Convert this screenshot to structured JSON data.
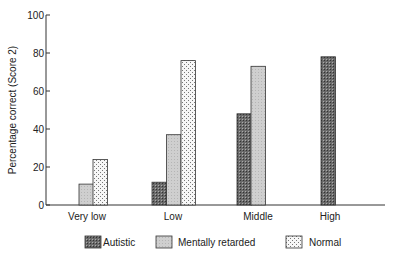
{
  "chart_data": {
    "type": "bar",
    "title": "",
    "xlabel": "",
    "ylabel": "Percentage correct (Score 2)",
    "ylim": [
      0,
      100
    ],
    "yticks": [
      0,
      20,
      40,
      60,
      80,
      100
    ],
    "categories": [
      "Very low",
      "Low",
      "Middle",
      "High"
    ],
    "series": [
      {
        "name": "Autistic",
        "pattern": "dark-crosshatch",
        "color": "#555555",
        "values": [
          null,
          12,
          48,
          78
        ]
      },
      {
        "name": "Mentally retarded",
        "pattern": "light-grey",
        "color": "#cccccc",
        "values": [
          11,
          37,
          73,
          null
        ]
      },
      {
        "name": "Normal",
        "pattern": "dotted",
        "color": "#f2f2f2",
        "values": [
          24,
          76,
          null,
          null
        ]
      }
    ],
    "grid": false,
    "legend_position": "bottom"
  },
  "legend": {
    "items": [
      {
        "label": "Autistic"
      },
      {
        "label": "Mentally retarded"
      },
      {
        "label": "Normal"
      }
    ]
  }
}
